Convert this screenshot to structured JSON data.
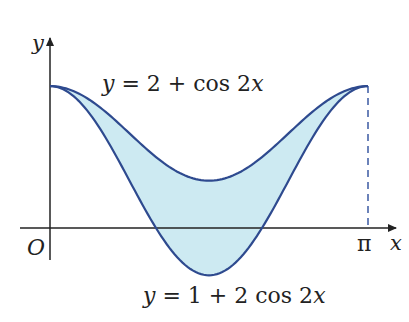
{
  "diagram": {
    "axes": {
      "x_label": "x",
      "y_label": "y",
      "origin_label": "O",
      "x_end_label": "π"
    },
    "curves": [
      {
        "name": "upper",
        "equation": "y = 2 + cos 2x",
        "label_parts": [
          "y",
          " = 2 + cos 2",
          "x"
        ]
      },
      {
        "name": "lower",
        "equation": "y = 1 + 2 cos 2x",
        "label_parts": [
          "y",
          " = 1 + 2 cos 2",
          "x"
        ]
      }
    ],
    "shaded_region": "between curves from x = 0 to x = π",
    "colors": {
      "curve": "#2e4a8f",
      "fill": "#cdeaf2",
      "axis": "#222222",
      "dashed": "#3b5aa3"
    }
  }
}
